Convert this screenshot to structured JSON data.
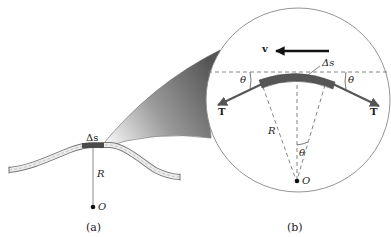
{
  "figure": {
    "panel_a": {
      "caption": "(a)",
      "labels": {
        "arc_segment": "Δs",
        "radius": "R",
        "center": "O"
      }
    },
    "panel_b": {
      "caption": "(b)",
      "labels": {
        "velocity": "v",
        "arc_segment": "Δs",
        "angle_left": "θ",
        "angle_right": "θ",
        "angle_center": "θ",
        "tension_left": "T",
        "tension_right": "T",
        "radius": "R",
        "center": "O"
      }
    },
    "colors": {
      "segment": "#555555",
      "rope_fill": "#e6e6e6",
      "rope_stroke": "#777777",
      "arrow": "#555555",
      "velocity_arrow": "#111111",
      "zoom_cone_dark": "#5a5a5a",
      "zoom_cone_light": "#f2f2f2",
      "circle_stroke": "#888888",
      "dashed": "#777777"
    }
  }
}
